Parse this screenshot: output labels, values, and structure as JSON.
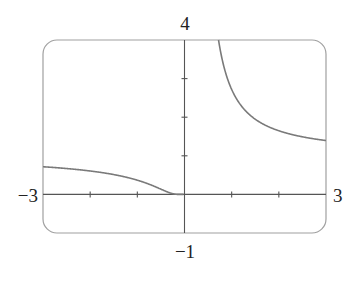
{
  "chart_data": {
    "type": "line",
    "title": "",
    "function": "y = e^(1/x)",
    "xlabel": "",
    "ylabel": "",
    "xlim": [
      -3,
      3
    ],
    "ylim": [
      -1,
      4
    ],
    "grid": false,
    "x_ticks": [
      -2,
      -1,
      1,
      2
    ],
    "y_ticks": [
      1,
      2,
      3
    ],
    "tick_labels": {
      "x_min": "−3",
      "x_max": "3",
      "y_min": "−1",
      "y_max": "4"
    },
    "series": [
      {
        "name": "left-branch",
        "x": [
          -3,
          -2.5,
          -2,
          -1.5,
          -1,
          -0.75,
          -0.5,
          -0.35,
          -0.25,
          -0.15,
          -0.05
        ],
        "y": [
          0.72,
          0.67,
          0.61,
          0.51,
          0.37,
          0.26,
          0.14,
          0.06,
          0.02,
          0.0,
          0.0
        ]
      },
      {
        "name": "right-branch",
        "x": [
          0.72,
          0.8,
          0.9,
          1.0,
          1.25,
          1.5,
          2.0,
          2.5,
          3.0
        ],
        "y": [
          4.0,
          3.49,
          3.04,
          2.72,
          2.23,
          1.95,
          1.65,
          1.49,
          1.4
        ]
      }
    ]
  },
  "colors": {
    "curve": "#7a7a7a",
    "axis": "#555555",
    "frame": "#9a9a9a"
  }
}
